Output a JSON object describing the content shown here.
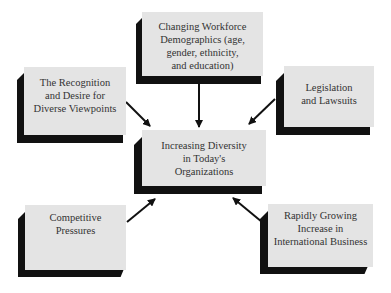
{
  "diagram": {
    "center": {
      "lines": [
        "Increasing Diversity",
        "in Today's",
        "Organizations"
      ]
    },
    "factors": [
      {
        "id": "demographics",
        "lines": [
          "Changing Workforce",
          "Demographics (age,",
          "gender, ethnicity,",
          "and education)"
        ]
      },
      {
        "id": "viewpoints",
        "lines": [
          "The Recognition",
          "and Desire for",
          "Diverse Viewpoints"
        ]
      },
      {
        "id": "legislation",
        "lines": [
          "Legislation",
          "and Lawsuits"
        ]
      },
      {
        "id": "competitive",
        "lines": [
          "Competitive",
          "Pressures"
        ]
      },
      {
        "id": "international",
        "lines": [
          "Rapidly Growing",
          "Increase in",
          "International Business"
        ]
      }
    ],
    "colors": {
      "box_face": "#e4e4e4",
      "box_shadow": "#111111",
      "arrow": "#111111",
      "text": "#333333"
    }
  }
}
